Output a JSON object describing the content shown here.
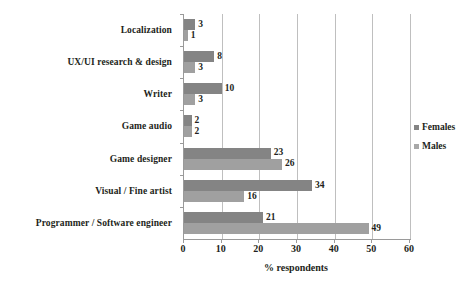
{
  "chart_data": {
    "type": "bar",
    "orientation": "horizontal",
    "title": "",
    "xlabel": "% respondents",
    "ylabel": "",
    "xlim": [
      0,
      60
    ],
    "xticks": [
      0,
      10,
      20,
      30,
      40,
      50,
      60
    ],
    "grid": true,
    "legend_position": "right",
    "categories": [
      "Localization",
      "UX/UI research & design",
      "Writer",
      "Game audio",
      "Game designer",
      "Visual / Fine artist",
      "Programmer / Software engineer"
    ],
    "series": [
      {
        "name": "Females",
        "color": "#848484",
        "values": [
          3,
          8,
          10,
          2,
          23,
          34,
          21
        ]
      },
      {
        "name": "Males",
        "color": "#a0a0a0",
        "values": [
          1,
          3,
          3,
          2,
          26,
          16,
          49
        ]
      }
    ]
  },
  "legend": {
    "items": [
      {
        "label": "Females",
        "swatch": "legend-swatch-females"
      },
      {
        "label": "Males",
        "swatch": "legend-swatch-males"
      }
    ]
  },
  "axis": {
    "x_title": "% respondents",
    "tick_labels": [
      "0",
      "10",
      "20",
      "30",
      "40",
      "50",
      "60"
    ]
  }
}
